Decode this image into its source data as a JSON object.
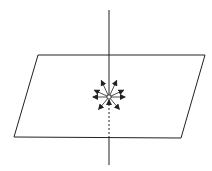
{
  "diagram": {
    "colors": {
      "stroke": "#222222",
      "background": "#ffffff"
    },
    "plane": {
      "points": [
        [
          38,
          55
        ],
        [
          205,
          55
        ],
        [
          181,
          138
        ],
        [
          14,
          137
        ]
      ]
    },
    "axis": {
      "x": 109,
      "y_top": 10,
      "y_bottom": 165,
      "dashed_from": 100,
      "dashed_to": 138
    },
    "center": {
      "x": 109,
      "y": 97,
      "r": 2.2
    },
    "arrows": [
      {
        "angle": -115,
        "length": 18
      },
      {
        "angle": -65,
        "length": 18
      },
      {
        "angle": -155,
        "length": 16
      },
      {
        "angle": -25,
        "length": 16
      },
      {
        "angle": 180,
        "length": 16
      },
      {
        "angle": 0,
        "length": 16
      },
      {
        "angle": 130,
        "length": 16
      },
      {
        "angle": 50,
        "length": 16
      },
      {
        "angle": 90,
        "length": 14
      }
    ]
  }
}
